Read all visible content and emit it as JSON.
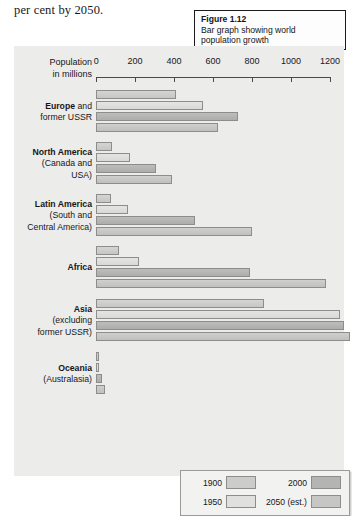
{
  "body_text": "per cent by 2050.",
  "caption": {
    "title": "Figure 1.12",
    "line1": "Bar graph showing world",
    "line2": "population growth"
  },
  "axis_caption": {
    "line1": "Population",
    "line2": "in millions"
  },
  "axis": {
    "ticks": [
      0,
      200,
      400,
      600,
      800,
      1000,
      1200
    ],
    "min": 0,
    "max": 1200
  },
  "legend": {
    "items": [
      {
        "label": "1900",
        "color": "#cccccb"
      },
      {
        "label": "1950",
        "color": "#e0e0df"
      },
      {
        "label": "2000",
        "color": "#b4b4b3"
      },
      {
        "label": "2050 (est.)",
        "color": "#c6c6c5"
      }
    ]
  },
  "chart_data": {
    "type": "bar",
    "orientation": "horizontal",
    "title": "Bar graph showing world population growth",
    "xlabel": "Population in millions",
    "ylabel": "",
    "xlim": [
      0,
      1200
    ],
    "grid": false,
    "legend_position": "bottom-right",
    "categories": [
      "Europe and former USSR",
      "North America (Canada and USA)",
      "Latin America (South and Central America)",
      "Africa",
      "Asia (excluding former USSR)",
      "Oceania (Australasia)"
    ],
    "series": [
      {
        "name": "1900",
        "values": [
          408,
          82,
          75,
          120,
          860,
          6
        ]
      },
      {
        "name": "1950",
        "values": [
          547,
          172,
          166,
          220,
          1250,
          13
        ]
      },
      {
        "name": "2000",
        "values": [
          728,
          310,
          510,
          790,
          3700,
          30
        ]
      },
      {
        "name": "2050 (est.)",
        "values": [
          628,
          392,
          800,
          1180,
          5000,
          46
        ]
      }
    ]
  },
  "groups": [
    {
      "label_html": "<b>Europe</b> and<br>former USSR",
      "label_text": "Europe and former USSR",
      "bars": [
        408,
        547,
        728,
        628
      ]
    },
    {
      "label_html": "<b>North America</b><br>(Canada and<br>USA)",
      "label_text": "North America (Canada and USA)",
      "bars": [
        82,
        172,
        310,
        392
      ]
    },
    {
      "label_html": "<b>Latin America</b><br>(South and<br>Central America)",
      "label_text": "Latin America (South and Central America)",
      "bars": [
        75,
        166,
        510,
        800
      ]
    },
    {
      "label_html": "<b>Africa</b>",
      "label_text": "Africa",
      "bars": [
        120,
        220,
        790,
        1180
      ]
    },
    {
      "label_html": "<b>Asia</b><br>(excluding<br>former USSR)",
      "label_text": "Asia (excluding former USSR)",
      "bars": [
        860,
        1250,
        3700,
        5000
      ]
    },
    {
      "label_html": "<b>Oceania</b><br>(Australasia)",
      "label_text": "Oceania (Australasia)",
      "bars": [
        6,
        13,
        30,
        46
      ]
    }
  ]
}
